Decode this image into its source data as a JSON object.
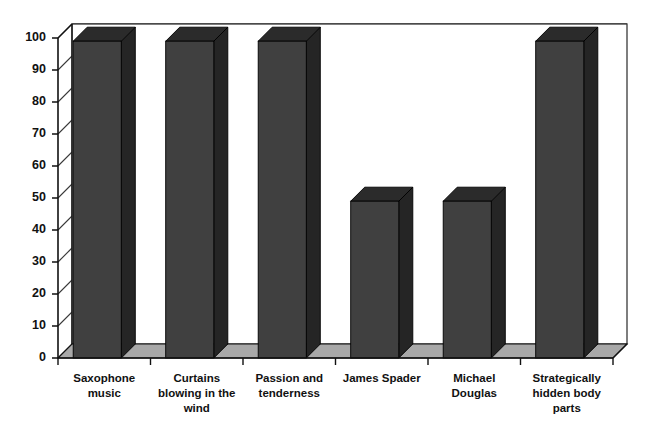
{
  "chart_data": {
    "type": "bar",
    "title": "",
    "subtitle": "",
    "xlabel": "",
    "ylabel": "",
    "categories": [
      "Saxophone music",
      "Curtains blowing in the wind",
      "Passion and tenderness",
      "James Spader",
      "Michael Douglas",
      "Strategically hidden body parts"
    ],
    "category_lines": [
      [
        "Saxophone",
        "music"
      ],
      [
        "Curtains",
        "blowing in the",
        "wind"
      ],
      [
        "Passion and",
        "tenderness"
      ],
      [
        "James Spader"
      ],
      [
        "Michael",
        "Douglas"
      ],
      [
        "Strategically",
        "hidden body",
        "parts"
      ]
    ],
    "values": [
      99,
      99,
      99,
      49,
      49,
      99
    ],
    "ylim": [
      0,
      100
    ],
    "ytick_labels": [
      "0",
      "10",
      "20",
      "30",
      "40",
      "50",
      "60",
      "70",
      "80",
      "90",
      "100"
    ],
    "ytick_values": [
      0,
      10,
      20,
      30,
      40,
      50,
      60,
      70,
      80,
      90,
      100
    ],
    "grid": true,
    "grid_axis": "y",
    "legend": false,
    "legend_position": "none",
    "style": "3d-column",
    "colors": {
      "bar_front": "#404040",
      "bar_top": "#2b2b2b",
      "bar_side": "#252525",
      "floor": "#a8a8a8",
      "gridline": "#3a3a3a",
      "axis": "#111111",
      "background": "#ffffff",
      "text": "#111111"
    }
  }
}
